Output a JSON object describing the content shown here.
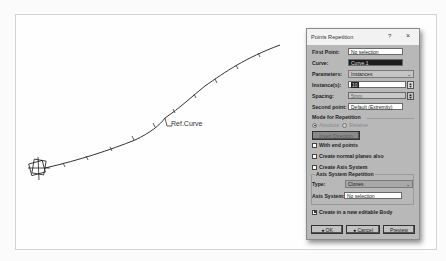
{
  "canvas": {
    "curve_label": "Ref.Curve"
  },
  "dialog": {
    "title": "Points Repetition",
    "help_label": "?",
    "close_label": "×",
    "first_point": {
      "label": "First Point:",
      "value": "No selection"
    },
    "curve": {
      "label": "Curve:",
      "value": "Curve.1"
    },
    "parameters": {
      "label": "Parameters:",
      "value": "Instances"
    },
    "instances": {
      "label": "Instance(s):",
      "value": "10"
    },
    "spacing": {
      "label": "Spacing:",
      "value": "5mm"
    },
    "second_point": {
      "label": "Second point:",
      "value": "Default (Extremity)"
    },
    "mode": {
      "label": "Mode for Repetition",
      "options": [
        {
          "label": "Absolute",
          "selected": true
        },
        {
          "label": "Relative",
          "selected": false
        }
      ]
    },
    "invert_button": "Invert Direction",
    "with_end_points": {
      "label": "With end points",
      "checked": false
    },
    "create_normal_planes": {
      "label": "Create normal planes also",
      "checked": false
    },
    "create_axis_system": {
      "label": "Create Axis System",
      "checked": false
    },
    "axis_group": {
      "label": "Axis System Repetition",
      "type": {
        "label": "Type:",
        "value": "Clones"
      },
      "axis_system": {
        "label": "Axis System:",
        "value": "No selection"
      }
    },
    "create_new_body": {
      "label": "Create in a new editable Body",
      "checked": true
    },
    "buttons": {
      "ok": "OK",
      "cancel": "Cancel",
      "preview": "Preview"
    }
  }
}
